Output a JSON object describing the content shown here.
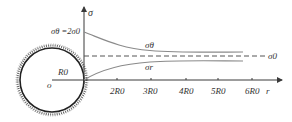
{
  "diagram": {
    "axis_y_label": "σ",
    "axis_x_label": "r",
    "origin_label": "o",
    "radius_label": "R0",
    "peak_label": "σθ =2σ0",
    "far_field_label": "σ0",
    "curve_theta_label": "σθ",
    "curve_r_label": "σr",
    "ticks": [
      "2R0",
      "3R0",
      "4R0",
      "5R0",
      "6R0"
    ],
    "colors": {
      "axes": "#3a3a3a",
      "curves": "#8a8a8a",
      "dashed": "#555555",
      "circle": "#222222"
    }
  }
}
